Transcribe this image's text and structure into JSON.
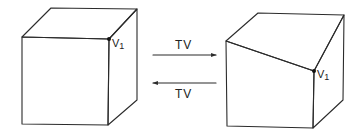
{
  "diagram": {
    "type": "transformation",
    "left_shape": {
      "name": "cube",
      "vertex_label": "V1",
      "vertex_label_main": "V",
      "vertex_label_sub": "1"
    },
    "right_shape": {
      "name": "truncated-cube",
      "vertex_label": "V1",
      "vertex_label_main": "V",
      "vertex_label_sub": "1"
    },
    "arrows": [
      {
        "direction": "left-to-right",
        "label": "TV"
      },
      {
        "direction": "right-to-left",
        "label": "TV"
      }
    ],
    "colors": {
      "line": "#2b2b2b",
      "background": "#ffffff"
    }
  }
}
